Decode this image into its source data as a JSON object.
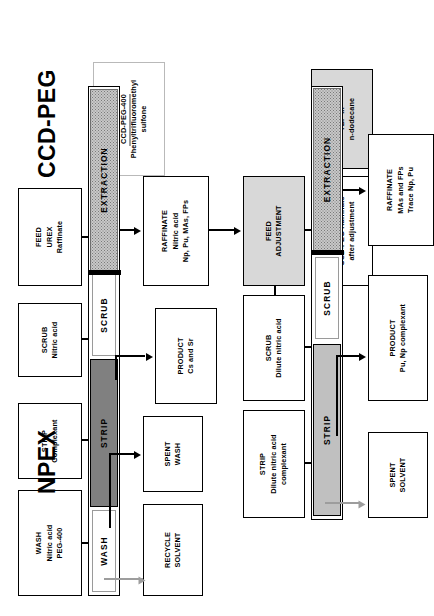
{
  "diagram": {
    "sections": [
      {
        "id": "ccd-peg",
        "label": "CCD-PEG"
      },
      {
        "id": "npex",
        "label": "NPEX"
      }
    ]
  },
  "ccd_peg": {
    "label": "CCD-PEG",
    "feed_inputs": [
      {
        "name": "solvent",
        "lines": [
          "SOLVENT",
          "CCD-PEG-400",
          "Phenyltrifluoromethyl",
          "sulfone"
        ]
      },
      {
        "name": "feed",
        "lines": [
          "FEED",
          "UREX",
          "Raffinate"
        ]
      },
      {
        "name": "scrub",
        "lines": [
          "SCRUB",
          "Nitric acid"
        ]
      },
      {
        "name": "strip",
        "lines": [
          "STRIP",
          "Complexant"
        ]
      },
      {
        "name": "wash",
        "lines": [
          "WASH",
          "Nitric acid",
          "PEG-400"
        ]
      }
    ],
    "column_segments": [
      {
        "name": "extraction",
        "label": "EXTRACTION",
        "fill": "dotted"
      },
      {
        "name": "scrub",
        "label": "SCRUB",
        "fill": "white"
      },
      {
        "name": "strip",
        "label": "STRIP",
        "fill": "dark-gray"
      },
      {
        "name": "wash",
        "label": "WASH",
        "fill": "white"
      }
    ],
    "outputs": [
      {
        "name": "raffinate",
        "lines": [
          "RAFFINATE",
          "Nitric acid",
          "Np, Pu, MAs, FPs"
        ]
      },
      {
        "name": "product",
        "lines": [
          "PRODUCT",
          "Cs and Sr"
        ]
      },
      {
        "name": "spent-wash",
        "lines": [
          "SPENT",
          "WASH"
        ]
      },
      {
        "name": "recycle-solvent",
        "lines": [
          "RECYCLE",
          "SOLVENT"
        ]
      }
    ],
    "feed_adjustment": {
      "lines": [
        "FEED",
        "ADJUSTMENT"
      ]
    }
  },
  "npex": {
    "label": "NPEX",
    "feed_inputs": [
      {
        "name": "solvent",
        "lines": [
          "SOLVENT",
          "TBP in",
          "n-dodecane"
        ]
      },
      {
        "name": "feed",
        "lines": [
          "FEED",
          "CCD-PEG Raffinate",
          "after adjustment"
        ]
      },
      {
        "name": "scrub",
        "lines": [
          "SCRUB",
          "Dilute nitric acid"
        ]
      },
      {
        "name": "strip",
        "lines": [
          "STRIP",
          "Dilute nitric acid",
          "complexant"
        ]
      }
    ],
    "column_segments": [
      {
        "name": "extraction",
        "label": "EXTRACTION",
        "fill": "dotted"
      },
      {
        "name": "scrub",
        "label": "SCRUB",
        "fill": "white"
      },
      {
        "name": "strip",
        "label": "STRIP",
        "fill": "mid-gray"
      }
    ],
    "outputs": [
      {
        "name": "raffinate",
        "lines": [
          "RAFFINATE",
          "MAs and FPs",
          "Trace Np, Pu"
        ]
      },
      {
        "name": "product",
        "lines": [
          "PRODUCT",
          "Pu, Np complexant"
        ]
      },
      {
        "name": "spent-solvent",
        "lines": [
          "SPENT",
          "SOLVENT"
        ]
      }
    ]
  },
  "colors": {
    "line": "#000000",
    "grey_line": "#9d9d9d",
    "strip_dark": "#808080",
    "strip_mid": "#c0c0c0",
    "shaded_box": "#d8d8d8",
    "dotted_fill": "#c8c8c8"
  }
}
